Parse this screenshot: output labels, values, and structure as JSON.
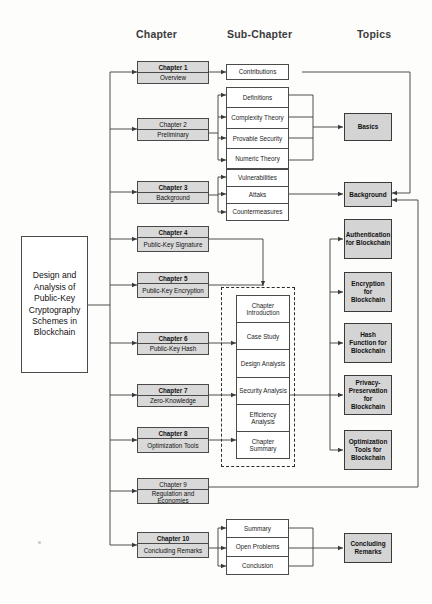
{
  "columns": {
    "chapter": "Chapter",
    "subchapter": "Sub-Chapter",
    "topics": "Topics"
  },
  "title_box": {
    "text": "Design and Analysis of Public-Key Cryptography Schemes in Blockchain"
  },
  "chapters": [
    {
      "num": "Chapter 1",
      "name": "Overview"
    },
    {
      "num": "Chapter 2",
      "name": "Preliminary"
    },
    {
      "num": "Chapter 3",
      "name": "Background"
    },
    {
      "num": "Chapter 4",
      "name": "Public-Key Signature"
    },
    {
      "num": "Chapter 5",
      "name": "Public-Key Encryption"
    },
    {
      "num": "Chapter 6",
      "name": "Public-Key Hash"
    },
    {
      "num": "Chapter 7",
      "name": "Zero-Knowledge"
    },
    {
      "num": "Chapter 8",
      "name": "Optimization Tools"
    },
    {
      "num": "Chapter 9",
      "name": "Regulation and Economies"
    },
    {
      "num": "Chapter 10",
      "name": "Concluding Remarks"
    }
  ],
  "subchapters": {
    "contributions": "Contributions",
    "preliminary_group": [
      "Definitions",
      "Complexity Theory",
      "Provable Security",
      "Numeric Theory"
    ],
    "background_group": [
      "Vulnerabilities",
      "Attaks",
      "Countermeasures"
    ],
    "chapter_structure": [
      "Chapter Introduction",
      "Case Study",
      "Design Analysis",
      "Security Analysis",
      "Efficiency Analysis",
      "Chapter Summary"
    ],
    "concluding_group": [
      "Summary",
      "Open Problems",
      "Conclusion"
    ]
  },
  "topics": [
    "Basics",
    "Background",
    "Authentication for Blockchain",
    "Encryption for Blockchain",
    "Hash Function for Blockchain",
    "Privacy-Preservation for Blockchain",
    "Optimization Tools for Blockchain",
    "Concluding Remarks"
  ],
  "colors": {
    "chapter_fill": "#d9d9d9",
    "topic_fill": "#d4d4d4",
    "node_fill": "#ffffff",
    "stroke": "#4a4a4a",
    "header_text": "#3b3b3b",
    "page_bg": "#fdfdfc"
  }
}
